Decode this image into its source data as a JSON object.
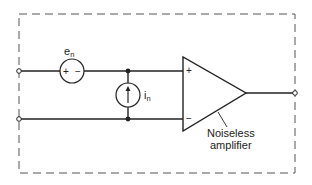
{
  "diagram": {
    "type": "circuit-schematic",
    "boundary": {
      "style": "dashed",
      "x": 19,
      "y": 14,
      "width": 276,
      "height": 159
    },
    "components": {
      "voltage_noise_source": {
        "label_main": "e",
        "label_sub": "n",
        "plus": "+",
        "minus": "−",
        "cx": 72,
        "cy": 71,
        "r": 12
      },
      "current_noise_source": {
        "label_main": "i",
        "label_sub": "n",
        "cx": 128,
        "cy": 95,
        "r": 12,
        "arrow_direction": "up"
      },
      "amplifier": {
        "label_line1": "Noiseless",
        "label_line2": "amplifier",
        "noninverting_symbol": "+",
        "inverting_symbol": "−"
      }
    },
    "terminals": [
      {
        "name": "input-top",
        "x": 19,
        "y": 71
      },
      {
        "name": "input-bottom",
        "x": 19,
        "y": 119
      },
      {
        "name": "output",
        "x": 295,
        "y": 93
      }
    ],
    "colors": {
      "line": "#222222",
      "dash": "#555555",
      "background": "#ffffff"
    }
  }
}
